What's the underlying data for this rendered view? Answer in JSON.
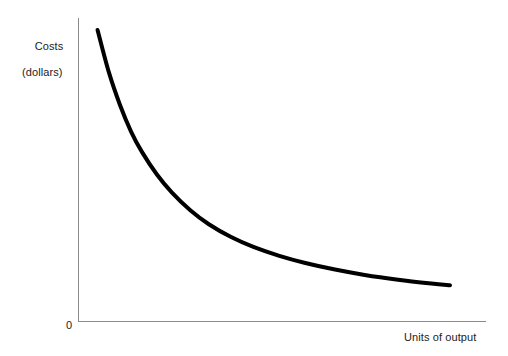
{
  "chart_data": {
    "type": "line",
    "title": "",
    "subtitle": "",
    "xlabel": "Units of output",
    "ylabel": "Costs",
    "ylabel_line2": "(dollars)",
    "origin_label": "0",
    "grid": false,
    "legend": null,
    "annotations": [],
    "xlim": [
      0,
      100
    ],
    "ylim": [
      0,
      100
    ],
    "xticks": [],
    "yticks": [],
    "xticklabels": [],
    "yticklabels": [],
    "series": [
      {
        "name": "Average cost",
        "color": "#000000",
        "linewidth": 4,
        "x": [
          5.0,
          8.0,
          11.0,
          14.0,
          17.0,
          21.0,
          25.0,
          30.0,
          35.0,
          41.0,
          47.0,
          54.0,
          61.0,
          69.0,
          77.0,
          86.0,
          95.0,
          100.0
        ],
        "y": [
          98.0,
          84.0,
          73.0,
          64.0,
          57.0,
          49.5,
          43.5,
          37.5,
          32.8,
          28.5,
          25.2,
          22.2,
          19.8,
          17.6,
          15.8,
          14.2,
          12.9,
          12.3
        ]
      }
    ],
    "axis_color": "#8a8a8a",
    "curve_color": "#000000",
    "background": "#ffffff"
  },
  "figure": {
    "width": 508,
    "height": 356
  }
}
